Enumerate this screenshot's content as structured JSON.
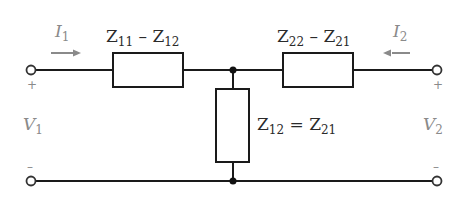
{
  "diagram": {
    "type": "two-port T-equivalent circuit (Z-parameters)",
    "series_left": {
      "main": "Z",
      "sub_a": "11",
      "op": " – ",
      "main_b": "Z",
      "sub_b": "12"
    },
    "series_right": {
      "main": "Z",
      "sub_a": "22",
      "op": " – ",
      "main_b": "Z",
      "sub_b": "21"
    },
    "shunt": {
      "main": "Z",
      "sub_a": "12",
      "op": " = ",
      "main_b": "Z",
      "sub_b": "21"
    },
    "current_left": {
      "symbol": "I",
      "sub": "1",
      "direction": "right"
    },
    "current_right": {
      "symbol": "I",
      "sub": "2",
      "direction": "left"
    },
    "voltage_left": {
      "symbol": "V",
      "sub": "1",
      "plus": "+",
      "minus": "–"
    },
    "voltage_right": {
      "symbol": "V",
      "sub": "2",
      "plus": "+",
      "minus": "–"
    },
    "colors": {
      "wire": "#1a1a1a",
      "annotation": "#8a8a8a"
    }
  }
}
